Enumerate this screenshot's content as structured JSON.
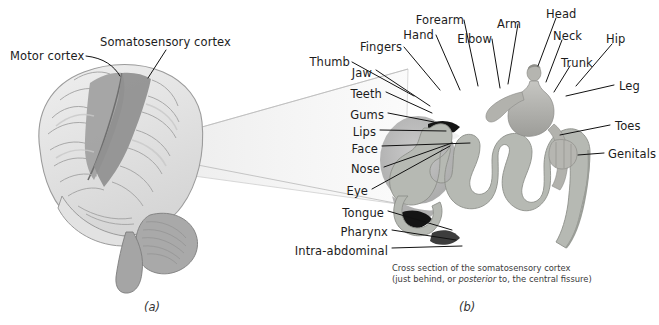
{
  "figure": {
    "panel_a": {
      "letter": "(a)",
      "labels": [
        {
          "id": "somatosensory-cortex",
          "text": "Somatosensory cortex",
          "x": 100,
          "y": 36
        },
        {
          "id": "motor-cortex",
          "text": "Motor cortex",
          "x": 10,
          "y": 50
        }
      ]
    },
    "panel_b": {
      "letter": "(b)",
      "caption_line1": "Cross section of the somatosensory cortex",
      "caption_line2_pre": "(just behind, or ",
      "caption_line2_italic": "posterior",
      "caption_line2_post": " to, the central fissure)",
      "labels_left": [
        {
          "id": "jaw",
          "text": "Jaw",
          "x": 355,
          "y": 73
        },
        {
          "id": "teeth",
          "text": "Teeth",
          "x": 355,
          "y": 95
        },
        {
          "id": "gums",
          "text": "Gums",
          "x": 355,
          "y": 116
        },
        {
          "id": "lips",
          "text": "Lips",
          "x": 355,
          "y": 132
        },
        {
          "id": "face",
          "text": "Face",
          "x": 355,
          "y": 149
        },
        {
          "id": "nose",
          "text": "Nose",
          "x": 355,
          "y": 170
        },
        {
          "id": "eye",
          "text": "Eye",
          "x": 350,
          "y": 192
        },
        {
          "id": "tongue",
          "text": "Tongue",
          "x": 352,
          "y": 214
        },
        {
          "id": "pharynx",
          "text": "Pharynx",
          "x": 352,
          "y": 233
        },
        {
          "id": "intra-abdominal",
          "text": "Intra-abdominal",
          "x": 388,
          "y": 251
        }
      ],
      "labels_top": [
        {
          "id": "thumb",
          "text": "Thumb",
          "x": 330,
          "y": 53
        },
        {
          "id": "fingers",
          "text": "Fingers",
          "x": 392,
          "y": 38
        },
        {
          "id": "hand",
          "text": "Hand",
          "x": 424,
          "y": 25
        },
        {
          "id": "forearm",
          "text": "Forearm",
          "x": 452,
          "y": 10
        },
        {
          "id": "elbow",
          "text": "Elbow",
          "x": 474,
          "y": 29
        },
        {
          "id": "arm",
          "text": "Arm",
          "x": 508,
          "y": 13
        },
        {
          "id": "head",
          "text": "Head",
          "x": 547,
          "y": 7
        },
        {
          "id": "neck",
          "text": "Neck",
          "x": 554,
          "y": 30
        },
        {
          "id": "trunk",
          "text": "Trunk",
          "x": 560,
          "y": 55
        },
        {
          "id": "hip",
          "text": "Hip",
          "x": 606,
          "y": 33
        }
      ],
      "labels_right": [
        {
          "id": "leg",
          "text": "Leg",
          "x": 618,
          "y": 87
        },
        {
          "id": "toes",
          "text": "Toes",
          "x": 614,
          "y": 127
        },
        {
          "id": "genitals",
          "text": "Genitals",
          "x": 608,
          "y": 155
        }
      ]
    }
  },
  "colors": {
    "background": "#ffffff",
    "brain_light": "#e9e9e9",
    "brain_mid": "#b9b9b9",
    "brain_dark": "#8e8e8e",
    "cortex_band": "#b3b6b0",
    "cortex_fill": "#ffffff",
    "leader_line": "#111111",
    "cone_fill": "#f1f1f1",
    "cone_edge": "#bdbdbd",
    "text": "#1c1c1c",
    "black_mass": "#151515"
  }
}
